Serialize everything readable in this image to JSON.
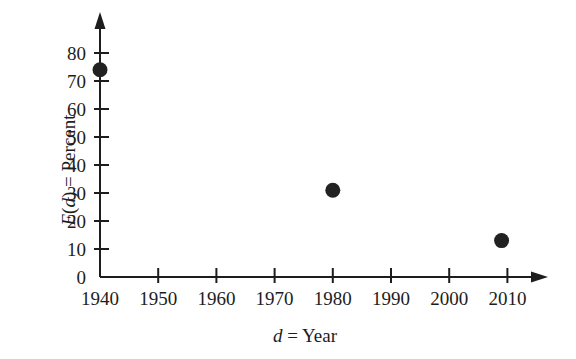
{
  "chart_data": {
    "type": "scatter",
    "title": "",
    "xlabel": "d = Year",
    "ylabel": "E(d) = Percent",
    "xlabel_parts": {
      "variable": "d",
      "equals": " = ",
      "text": "Year"
    },
    "ylabel_parts": {
      "function": "E",
      "open_paren": "(",
      "argument": "d",
      "close_paren": ")",
      "equals": " = ",
      "text": "Percent"
    },
    "xlim": [
      1940,
      2012
    ],
    "ylim": [
      0,
      85
    ],
    "x_ticks": [
      1940,
      1950,
      1960,
      1970,
      1980,
      1990,
      2000,
      2010
    ],
    "x_tick_labels": [
      "1940",
      "1950",
      "1960",
      "1970",
      "1980",
      "1990",
      "2000",
      "2010"
    ],
    "y_ticks": [
      0,
      10,
      20,
      30,
      40,
      50,
      60,
      70,
      80
    ],
    "y_tick_labels": [
      "0",
      "10",
      "20",
      "30",
      "40",
      "50",
      "60",
      "70",
      "80"
    ],
    "grid": false,
    "legend": null,
    "axis_arrows": true,
    "marker": "filled-circle",
    "marker_color": "#222222",
    "axis_color": "#1d1d1d",
    "points": [
      {
        "x": 1940,
        "y": 74,
        "label": "1940, 74"
      },
      {
        "x": 1980,
        "y": 31,
        "label": "1980, 31"
      },
      {
        "x": 2009,
        "y": 13,
        "label": "2009, 13"
      }
    ]
  }
}
